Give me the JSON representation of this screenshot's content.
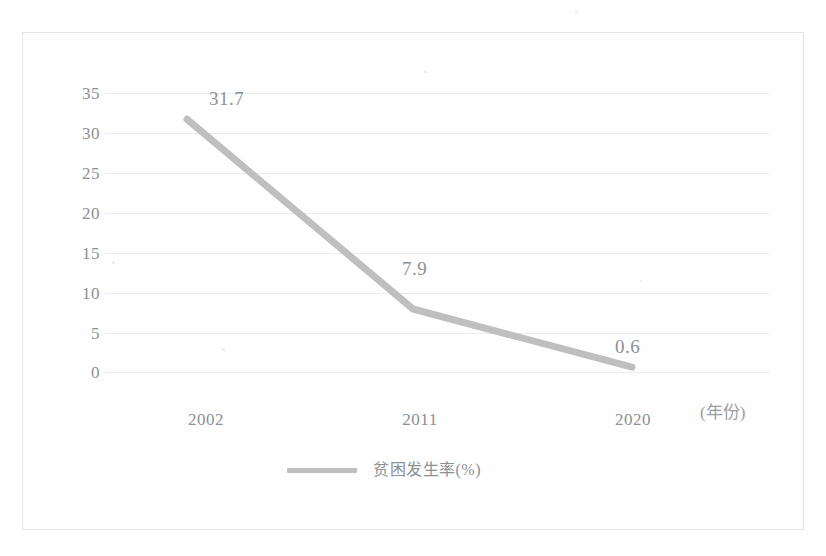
{
  "chart_data": {
    "type": "line",
    "title": "",
    "subtitle": "",
    "xlabel": "(年份)",
    "ylabel": "",
    "categories": [
      "2002",
      "2011",
      "2020"
    ],
    "series": [
      {
        "name": "贫困发生率(%)",
        "values": [
          31.7,
          7.9,
          0.6
        ],
        "color": "#bfbfbf"
      }
    ],
    "point_labels": [
      "31.7",
      "7.9",
      "0.6"
    ],
    "ylim": [
      0,
      35
    ],
    "y_ticks": [
      "0",
      "5",
      "10",
      "15",
      "20",
      "25",
      "30",
      "35"
    ],
    "grid": true,
    "legend_position": "bottom",
    "legend_entries": [
      "贫困发生率(%)"
    ]
  },
  "axes": {
    "y_tick_labels": [
      "35",
      "30",
      "25",
      "20",
      "15",
      "10",
      "5",
      "0"
    ],
    "x_tick_labels": [
      "2002",
      "2011",
      "2020"
    ],
    "x_unit_label": "(年份)"
  },
  "legend": {
    "swatch_name": "series-line-swatch",
    "label": "贫困发生率(%)"
  },
  "labels": {
    "p0": "31.7",
    "p1": "7.9",
    "p2": "0.6"
  },
  "colors": {
    "series_line": "#bfbfbf",
    "gridline": "#eceef0",
    "frame": "#e2e4e6",
    "text": "#8d9094",
    "background": "#ffffff"
  }
}
